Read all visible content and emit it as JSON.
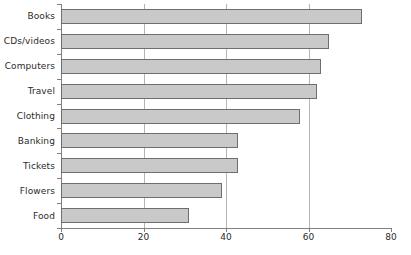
{
  "chart_data": {
    "type": "bar",
    "orientation": "horizontal",
    "title": "",
    "subtitle": "",
    "xlabel": "",
    "ylabel": "",
    "categories": [
      "Books",
      "CDs/videos",
      "Computers",
      "Travel",
      "Clothing",
      "Banking",
      "Tickets",
      "Flowers",
      "Food"
    ],
    "values": [
      73,
      65,
      63,
      62,
      58,
      43,
      43,
      39,
      31
    ],
    "xlim": [
      0,
      80
    ],
    "xticks": [
      0,
      20,
      40,
      60,
      80
    ],
    "xtick_labels": [
      "0",
      "20",
      "40",
      "60",
      "80"
    ],
    "gridlines": [
      20,
      40,
      60
    ],
    "grid": true,
    "legend": null,
    "annotations": [],
    "series": [
      {
        "name": "",
        "values": [
          73,
          65,
          63,
          62,
          58,
          43,
          43,
          39,
          31
        ]
      }
    ]
  },
  "style": {
    "bar_fill": "#c9c9c9",
    "bar_border": "#6e6e6e",
    "axis_color": "#808080",
    "grid_color": "#b4b4b4",
    "text_color": "#2b2b2b",
    "background": "#ffffff"
  }
}
